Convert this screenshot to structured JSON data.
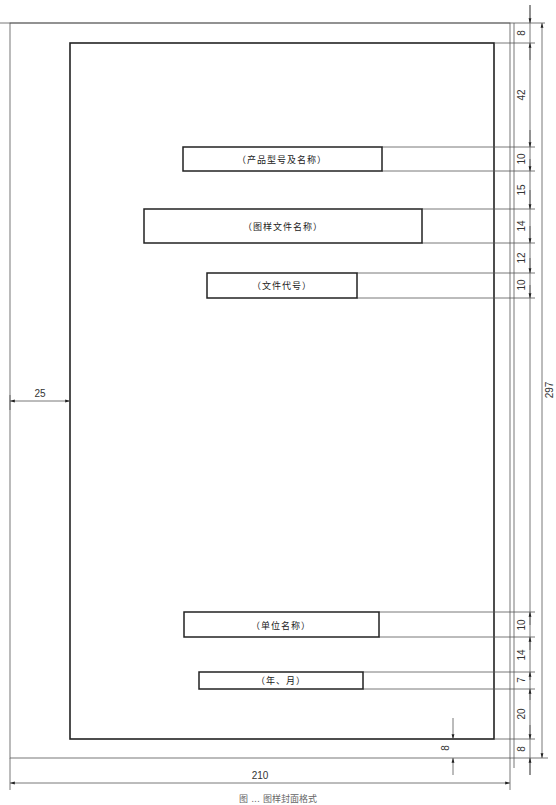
{
  "diagram": {
    "title_boxes": [
      {
        "id": "product",
        "label": "（产品型号及名称）"
      },
      {
        "id": "drawing",
        "label": "（图样文件名称）"
      },
      {
        "id": "doc_code",
        "label": "（文件代号）"
      },
      {
        "id": "company",
        "label": "（单位名称）"
      },
      {
        "id": "date",
        "label": "（年、月）"
      }
    ],
    "dimensions": {
      "right_column": [
        "8",
        "42",
        "10",
        "15",
        "14",
        "12",
        "10",
        "10",
        "14",
        "7",
        "20",
        "8"
      ],
      "page_height": "297",
      "page_width": "210",
      "left_margin": "25",
      "bottom_margin": "8"
    },
    "caption": "图 ... 图样封面格式"
  },
  "colors": {
    "line": "#222222",
    "thin_line": "#555555",
    "background": "#ffffff"
  }
}
